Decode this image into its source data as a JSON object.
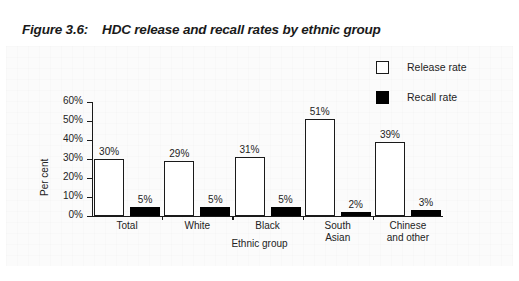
{
  "figure": {
    "number": "Figure 3.6:",
    "title": "HDC release and recall rates by ethnic group"
  },
  "legend": {
    "items": [
      {
        "label": "Release rate",
        "swatch": "white-square-outline",
        "color": "#ffffff"
      },
      {
        "label": "Recall rate",
        "swatch": "black-square",
        "color": "#000000"
      }
    ]
  },
  "axes": {
    "y_title": "Per cent",
    "x_title": "Ethnic group",
    "y_ticks": [
      "0%",
      "10%",
      "20%",
      "30%",
      "40%",
      "50%",
      "60%"
    ]
  },
  "chart_data": {
    "type": "bar",
    "title": "HDC release and recall rates by ethnic group",
    "xlabel": "Ethnic group",
    "ylabel": "Per cent",
    "ylim": [
      0,
      60
    ],
    "yticks": [
      0,
      10,
      20,
      30,
      40,
      50,
      60
    ],
    "ytick_labels": [
      "0%",
      "10%",
      "20%",
      "30%",
      "40%",
      "50%",
      "60%"
    ],
    "grid": false,
    "legend_position": "top-right",
    "categories": [
      "Total",
      "White",
      "Black",
      "South Asian",
      "Chinese and other"
    ],
    "category_lines": [
      [
        "Total"
      ],
      [
        "White"
      ],
      [
        "Black"
      ],
      [
        "South",
        "Asian"
      ],
      [
        "Chinese",
        "and other"
      ]
    ],
    "series": [
      {
        "name": "Release rate",
        "values": [
          30,
          29,
          31,
          51,
          39
        ],
        "labels": [
          "30%",
          "29%",
          "31%",
          "51%",
          "39%"
        ],
        "color": "#ffffff",
        "edge_color": "#1a1a1a"
      },
      {
        "name": "Recall rate",
        "values": [
          5,
          5,
          5,
          2,
          3
        ],
        "labels": [
          "5%",
          "5%",
          "5%",
          "2%",
          "3%"
        ],
        "color": "#000000",
        "edge_color": "#000000"
      }
    ]
  }
}
